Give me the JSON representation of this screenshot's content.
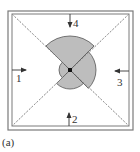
{
  "figure": {
    "caption": "(a)",
    "frame": {
      "outer": {
        "x": 8,
        "y": 11,
        "w": 125,
        "h": 119
      },
      "inner": {
        "x": 12,
        "y": 14,
        "w": 117,
        "h": 112
      },
      "stroke": "#7a7a7a"
    },
    "center": {
      "x": 70,
      "y": 70
    },
    "diagonals": {
      "stroke": "#9a9a9a",
      "dash": "2,1.5"
    },
    "shape": {
      "fill": "#bdbdbd",
      "stroke": "#555555",
      "sectors": [
        {
          "name": "top",
          "start_deg": 225,
          "end_deg": 315,
          "radius": 34
        },
        {
          "name": "right",
          "start_deg": 315,
          "end_deg": 405,
          "radius": 26
        },
        {
          "name": "bottom",
          "start_deg": 45,
          "end_deg": 135,
          "radius": 19
        },
        {
          "name": "left",
          "start_deg": 135,
          "end_deg": 225,
          "radius": 11
        }
      ],
      "center_dot_color": "#111111"
    },
    "arrows": [
      {
        "label": "1",
        "direction": "right",
        "x1": 12,
        "y1": 70,
        "x2": 26,
        "y2": 70,
        "label_x": 16,
        "label_y": 82
      },
      {
        "label": "2",
        "direction": "up",
        "x1": 69,
        "y1": 126,
        "x2": 69,
        "y2": 113,
        "label_x": 72,
        "label_y": 123
      },
      {
        "label": "3",
        "direction": "left",
        "x1": 129,
        "y1": 71,
        "x2": 115,
        "y2": 71,
        "label_x": 117,
        "label_y": 86
      },
      {
        "label": "4",
        "direction": "down",
        "x1": 70,
        "y1": 14,
        "x2": 70,
        "y2": 27,
        "label_x": 73,
        "label_y": 27
      }
    ],
    "arrow_color": "#333333"
  }
}
